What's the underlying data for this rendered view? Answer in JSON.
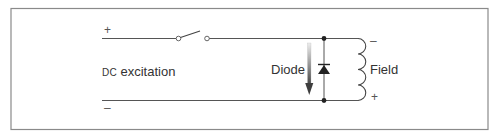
{
  "diagram": {
    "type": "circuit",
    "title": "",
    "labels": {
      "source": {
        "prefix": "DC",
        "text": " excitation"
      },
      "diode": "Diode",
      "field": "Field",
      "source_plus": "+",
      "source_minus": "–",
      "field_minus": "–",
      "field_plus": "+"
    },
    "components": [
      {
        "id": "dc-source",
        "kind": "dc-excitation-terminals"
      },
      {
        "id": "switch",
        "kind": "switch",
        "state": "open"
      },
      {
        "id": "diode",
        "kind": "diode",
        "orientation": "cathode-up"
      },
      {
        "id": "field-coil",
        "kind": "inductor",
        "turns": 4
      },
      {
        "id": "current-arrow",
        "kind": "arrow",
        "direction": "down"
      }
    ],
    "colors": {
      "line": "#555555",
      "border": "#8a8a8a",
      "arrow_top": "#e6e6e6",
      "arrow_bottom": "#4a4a4a"
    }
  }
}
